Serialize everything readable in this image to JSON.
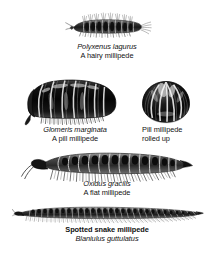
{
  "plate": {
    "title": "Millipede illustration plate",
    "background_color": "#ffffff",
    "ink_color": "#111111"
  },
  "figures": [
    {
      "id": "polyxenus",
      "name": "hairy-millipede",
      "scientific_name": "Polyxenus lagurus",
      "common_name": "A hairy millipede",
      "caption_style": "scientific-italic-then-common",
      "description": "small bristly millipede with tufts of hairs along back and a terminal brush of bristles"
    },
    {
      "id": "glomeris",
      "name": "pill-millipede",
      "scientific_name": "Glomeris marginata",
      "common_name": "A pill millipede",
      "caption_style": "scientific-italic-then-common",
      "description": "stout glossy dark segmented pill millipede, extended, with short legs"
    },
    {
      "id": "glomeris-rolled",
      "name": "pill-millipede-rolled-up",
      "line1": "Pill millipede",
      "line2": "rolled up",
      "caption_style": "common-two-lines",
      "description": "pill millipede curled into a tight glossy ball showing radial segment plates"
    },
    {
      "id": "oxidus",
      "name": "flat-millipede",
      "scientific_name": "Oxidus gracilis",
      "common_name": "A flat millipede",
      "caption_style": "scientific-italic-then-common",
      "description": "elongate flat-backed millipede with lateral keels, dark dorsal spots and many pale legs"
    },
    {
      "id": "blaniulus",
      "name": "spotted-snake-millipede",
      "common_name": "Spotted snake millipede",
      "scientific_name": "Blaniulus guttulatus",
      "caption_style": "common-bold-then-scientific",
      "description": "very long slender cylindrical millipede with fine segmentation and numerous minute legs"
    }
  ]
}
